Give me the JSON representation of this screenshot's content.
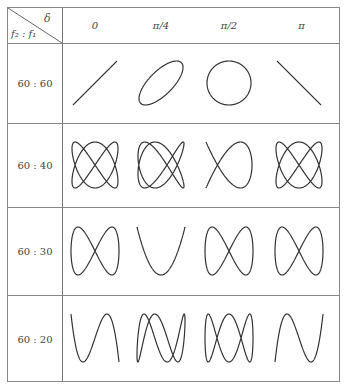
{
  "table": {
    "corner": {
      "top_label": "δ",
      "bottom_label": "f₂ : f₁"
    },
    "columns": [
      "0",
      "π/4",
      "π/2",
      "π"
    ],
    "rows": [
      {
        "label": "60 : 60",
        "a": 1,
        "b": 1
      },
      {
        "label": "60 : 40",
        "a": 3,
        "b": 2
      },
      {
        "label": "60 : 30",
        "a": 2,
        "b": 1
      },
      {
        "label": "60 : 20",
        "a": 3,
        "b": 1
      }
    ],
    "phases": [
      0,
      0.7853981634,
      1.5707963268,
      3.1415926536
    ],
    "stroke_color": "#333333"
  }
}
